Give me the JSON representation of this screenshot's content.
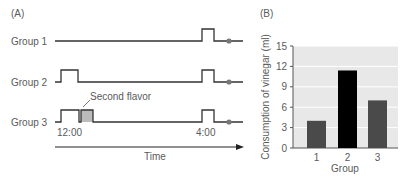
{
  "panel_a": {
    "label": "(A)",
    "groups": [
      {
        "name": "Group 1",
        "baseline_y": 41,
        "pulses": [
          {
            "x1": 202,
            "x2": 214,
            "fill": "none"
          }
        ]
      },
      {
        "name": "Group 2",
        "baseline_y": 82,
        "pulses": [
          {
            "x1": 61,
            "x2": 78,
            "fill": "none"
          },
          {
            "x1": 202,
            "x2": 214,
            "fill": "none"
          }
        ]
      },
      {
        "name": "Group 3",
        "baseline_y": 122,
        "pulses": [
          {
            "x1": 61,
            "x2": 79,
            "fill": "none"
          },
          {
            "x1": 81,
            "x2": 93,
            "fill": "#bbbbbb"
          },
          {
            "x1": 202,
            "x2": 214,
            "fill": "none"
          }
        ]
      }
    ],
    "annotation": "Second ﬂavor",
    "time_labels": {
      "start": "12:00",
      "end": "4:00"
    },
    "axis_label": "Time"
  },
  "panel_b": {
    "label": "(B)"
  },
  "chart_data": {
    "type": "bar",
    "title": "",
    "xlabel": "Group",
    "ylabel": "Consumption of vinegar (ml)",
    "categories": [
      "1",
      "2",
      "3"
    ],
    "values": [
      4,
      11.4,
      7
    ],
    "bar_colors": [
      "#4a4a4a",
      "#000000",
      "#4a4a4a"
    ],
    "ylim": [
      0,
      15
    ],
    "yticks": [
      0,
      3,
      6,
      9,
      12,
      15
    ],
    "grid": true,
    "background": "#e8e8e8",
    "legend": null
  }
}
